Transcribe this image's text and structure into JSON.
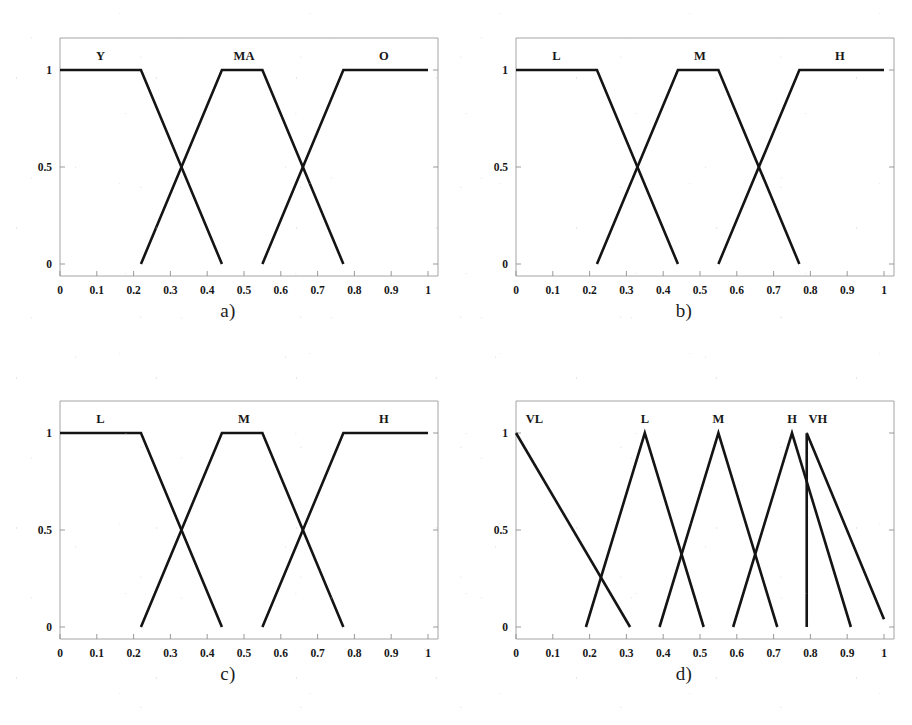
{
  "figure": {
    "panel_count": 4,
    "line_color": "#141414",
    "axis_color": "#9a9a9a",
    "background": "#ffffff"
  },
  "axes_common": {
    "xlim": [
      0,
      1
    ],
    "ylim": [
      0,
      1
    ],
    "xticks": [
      0,
      0.1,
      0.2,
      0.3,
      0.4,
      0.5,
      0.6,
      0.7,
      0.8,
      0.9,
      1
    ],
    "xticklabels": [
      "0",
      "0.1",
      "0.2",
      "0.3",
      "0.4",
      "0.5",
      "0.6",
      "0.7",
      "0.8",
      "0.9",
      "1"
    ],
    "yticks": [
      0,
      0.5,
      1
    ],
    "yticklabels": [
      "0",
      "0.5",
      "1"
    ],
    "grid": false
  },
  "chart_data": [
    {
      "id": "a",
      "type": "line",
      "caption": "a)",
      "title": "",
      "xlabel": "",
      "ylabel": "",
      "xlim": [
        0,
        1
      ],
      "ylim": [
        0,
        1
      ],
      "xticks": [
        0,
        0.1,
        0.2,
        0.3,
        0.4,
        0.5,
        0.6,
        0.7,
        0.8,
        0.9,
        1
      ],
      "xticklabels": [
        "0",
        "0.1",
        "0.2",
        "0.3",
        "0.4",
        "0.5",
        "0.6",
        "0.7",
        "0.8",
        "0.9",
        "1"
      ],
      "yticks": [
        0,
        0.5,
        1
      ],
      "yticklabels": [
        "0",
        "0.5",
        "1"
      ],
      "grid": false,
      "legend_position": "inside-top",
      "series": [
        {
          "name": "Y",
          "label": "Y",
          "label_x": 0.11,
          "shape": "trapezoid",
          "x": [
            0,
            0.22,
            0.44
          ],
          "y": [
            1,
            1,
            0
          ]
        },
        {
          "name": "MA",
          "label": "MA",
          "label_x": 0.5,
          "shape": "trapezoid",
          "x": [
            0.22,
            0.44,
            0.55,
            0.77
          ],
          "y": [
            0,
            1,
            1,
            0
          ]
        },
        {
          "name": "O",
          "label": "O",
          "label_x": 0.88,
          "shape": "trapezoid",
          "x": [
            0.55,
            0.77,
            1
          ],
          "y": [
            0,
            1,
            1
          ]
        }
      ]
    },
    {
      "id": "b",
      "type": "line",
      "caption": "b)",
      "title": "",
      "xlabel": "",
      "ylabel": "",
      "xlim": [
        0,
        1
      ],
      "ylim": [
        0,
        1
      ],
      "xticks": [
        0,
        0.1,
        0.2,
        0.3,
        0.4,
        0.5,
        0.6,
        0.7,
        0.8,
        0.9,
        1
      ],
      "xticklabels": [
        "0",
        "0.1",
        "0.2",
        "0.3",
        "0.4",
        "0.5",
        "0.6",
        "0.7",
        "0.8",
        "0.9",
        "1"
      ],
      "yticks": [
        0,
        0.5,
        1
      ],
      "yticklabels": [
        "0",
        "0.5",
        "1"
      ],
      "grid": false,
      "legend_position": "inside-top",
      "series": [
        {
          "name": "L",
          "label": "L",
          "label_x": 0.11,
          "shape": "trapezoid",
          "x": [
            0,
            0.22,
            0.44
          ],
          "y": [
            1,
            1,
            0
          ]
        },
        {
          "name": "M",
          "label": "M",
          "label_x": 0.5,
          "shape": "trapezoid",
          "x": [
            0.22,
            0.44,
            0.55,
            0.77
          ],
          "y": [
            0,
            1,
            1,
            0
          ]
        },
        {
          "name": "H",
          "label": "H",
          "label_x": 0.88,
          "shape": "trapezoid",
          "x": [
            0.55,
            0.77,
            1
          ],
          "y": [
            0,
            1,
            1
          ]
        }
      ]
    },
    {
      "id": "c",
      "type": "line",
      "caption": "c)",
      "title": "",
      "xlabel": "",
      "ylabel": "",
      "xlim": [
        0,
        1
      ],
      "ylim": [
        0,
        1
      ],
      "xticks": [
        0,
        0.1,
        0.2,
        0.3,
        0.4,
        0.5,
        0.6,
        0.7,
        0.8,
        0.9,
        1
      ],
      "xticklabels": [
        "0",
        "0.1",
        "0.2",
        "0.3",
        "0.4",
        "0.5",
        "0.6",
        "0.7",
        "0.8",
        "0.9",
        "1"
      ],
      "yticks": [
        0,
        0.5,
        1
      ],
      "yticklabels": [
        "0",
        "0.5",
        "1"
      ],
      "grid": false,
      "legend_position": "inside-top",
      "series": [
        {
          "name": "L",
          "label": "L",
          "label_x": 0.11,
          "shape": "trapezoid",
          "x": [
            0,
            0.22,
            0.44
          ],
          "y": [
            1,
            1,
            0
          ]
        },
        {
          "name": "M",
          "label": "M",
          "label_x": 0.5,
          "shape": "trapezoid",
          "x": [
            0.22,
            0.44,
            0.55,
            0.77
          ],
          "y": [
            0,
            1,
            1,
            0
          ]
        },
        {
          "name": "H",
          "label": "H",
          "label_x": 0.88,
          "shape": "trapezoid",
          "x": [
            0.55,
            0.77,
            1
          ],
          "y": [
            0,
            1,
            1
          ]
        }
      ]
    },
    {
      "id": "d",
      "type": "line",
      "caption": "d)",
      "title": "",
      "xlabel": "",
      "ylabel": "",
      "xlim": [
        0,
        1
      ],
      "ylim": [
        0,
        1
      ],
      "xticks": [
        0,
        0.1,
        0.2,
        0.3,
        0.4,
        0.5,
        0.6,
        0.7,
        0.8,
        0.9,
        1
      ],
      "xticklabels": [
        "0",
        "0.1",
        "0.2",
        "0.3",
        "0.4",
        "0.5",
        "0.6",
        "0.7",
        "0.8",
        "0.9",
        "1"
      ],
      "yticks": [
        0,
        0.5,
        1
      ],
      "yticklabels": [
        "0",
        "0.5",
        "1"
      ],
      "grid": false,
      "legend_position": "inside-top",
      "series": [
        {
          "name": "VL",
          "label": "VL",
          "label_x": 0.05,
          "shape": "triangle-right",
          "x": [
            0,
            0.31
          ],
          "y": [
            1,
            0
          ]
        },
        {
          "name": "L",
          "label": "L",
          "label_x": 0.35,
          "shape": "triangle",
          "x": [
            0.19,
            0.35,
            0.51
          ],
          "y": [
            0,
            1,
            0
          ]
        },
        {
          "name": "M",
          "label": "M",
          "label_x": 0.55,
          "shape": "triangle",
          "x": [
            0.39,
            0.55,
            0.71
          ],
          "y": [
            0,
            1,
            0
          ]
        },
        {
          "name": "H",
          "label": "H",
          "label_x": 0.75,
          "shape": "triangle",
          "x": [
            0.59,
            0.75,
            0.91
          ],
          "y": [
            0,
            1,
            0
          ]
        },
        {
          "name": "VH",
          "label": "VH",
          "label_x": 0.82,
          "shape": "triangle-left",
          "x": [
            0.79,
            0.79,
            1.0
          ],
          "y": [
            0,
            1,
            0.04
          ]
        }
      ]
    }
  ]
}
